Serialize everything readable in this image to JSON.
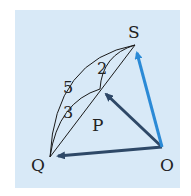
{
  "diagram": {
    "background_color": "#d8e9f7",
    "points": {
      "S": {
        "label": "S",
        "x": 135,
        "y": 45
      },
      "O": {
        "label": "O",
        "x": 162,
        "y": 147
      },
      "Q": {
        "label": "Q",
        "x": 50,
        "y": 157
      },
      "P": {
        "label": "P",
        "x": 100,
        "y": 89
      }
    },
    "ratio_labels": {
      "outer": "5",
      "inner": "3",
      "upper": "2"
    },
    "vectors": [
      {
        "from": "O",
        "to": "S",
        "color": "#2b8ad6"
      },
      {
        "from": "O",
        "to": "P",
        "color": "#2e4867"
      },
      {
        "from": "O",
        "to": "Q",
        "color": "#2e4867"
      }
    ],
    "segments": [
      {
        "from": "Q",
        "to": "S"
      }
    ]
  }
}
